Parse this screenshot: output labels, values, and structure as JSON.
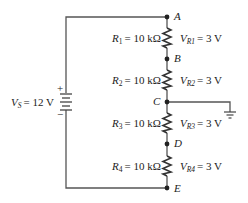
{
  "circuit": {
    "source": {
      "label": "V",
      "subscript": "S",
      "value": "= 12 V",
      "plus": "+",
      "minus": "−"
    },
    "nodes": [
      {
        "name": "A",
        "y": 17
      },
      {
        "name": "B",
        "y": 59
      },
      {
        "name": "C",
        "y": 102
      },
      {
        "name": "D",
        "y": 144
      },
      {
        "name": "E",
        "y": 188
      }
    ],
    "resistors": [
      {
        "label": "R",
        "subscript": "1",
        "value": "= 10 kΩ",
        "vlabel": "V",
        "vsubscript": "R1",
        "voltage": "= 3 V"
      },
      {
        "label": "R",
        "subscript": "2",
        "value": "= 10 kΩ",
        "vlabel": "V",
        "vsubscript": "R2",
        "voltage": "= 3 V"
      },
      {
        "label": "R",
        "subscript": "3",
        "value": "= 10 kΩ",
        "vlabel": "V",
        "vsubscript": "R3",
        "voltage": "= 3 V"
      },
      {
        "label": "R",
        "subscript": "4",
        "value": "= 10 kΩ",
        "vlabel": "V",
        "vsubscript": "R4",
        "voltage": "= 3 V"
      }
    ],
    "ground_node": "C",
    "colors": {
      "wire": "#555555",
      "text": "#222222",
      "node": "#222222"
    }
  }
}
